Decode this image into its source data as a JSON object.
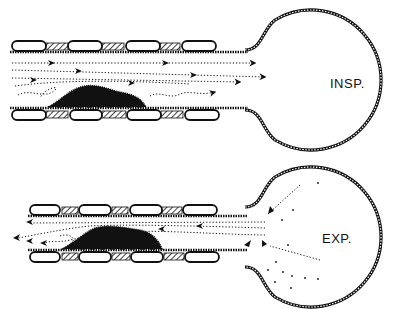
{
  "diagram": {
    "panels": [
      {
        "id": "inspiration",
        "label": "INSP.",
        "flow_direction": "into-sac"
      },
      {
        "id": "expiration",
        "label": "EXP.",
        "flow_direction": "out-of-sac"
      }
    ],
    "colors": {
      "ink": "#111111",
      "background": "#ffffff"
    }
  }
}
